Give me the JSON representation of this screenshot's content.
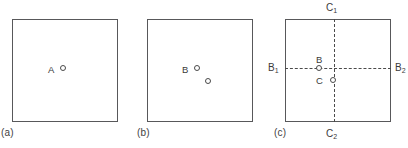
{
  "figure": {
    "type": "schematic-diagram",
    "panel_count": 3,
    "stroke_color": "#58585a",
    "text_color": "#3a3a3a"
  },
  "panels": [
    {
      "caption": "(a)",
      "points": [
        {
          "label": "A",
          "marker": "open-circle"
        }
      ],
      "axes": []
    },
    {
      "caption": "(b)",
      "points": [
        {
          "label": "B",
          "marker": "open-circle"
        },
        {
          "label": "",
          "marker": "open-circle"
        }
      ],
      "axes": []
    },
    {
      "caption": "(c)",
      "points": [
        {
          "label": "B",
          "marker": "open-circle"
        },
        {
          "label": "C",
          "marker": "open-circle"
        }
      ],
      "axes": [
        {
          "orientation": "vertical",
          "style": "dashed",
          "start_label": "C",
          "start_sub": "1",
          "end_label": "C",
          "end_sub": "2"
        },
        {
          "orientation": "horizontal",
          "style": "dashed",
          "start_label": "B",
          "start_sub": "1",
          "end_label": "B",
          "end_sub": "2"
        }
      ]
    }
  ],
  "labels": {
    "caption_a": "(a)",
    "caption_b": "(b)",
    "caption_c": "(c)",
    "point_a": "A",
    "point_b": "B",
    "panel_c_point_b": "B",
    "panel_c_point_c": "C",
    "axis_c1_base": "C",
    "axis_c1_sub": "1",
    "axis_c2_base": "C",
    "axis_c2_sub": "2",
    "axis_b1_base": "B",
    "axis_b1_sub": "1",
    "axis_b2_base": "B",
    "axis_b2_sub": "2"
  }
}
